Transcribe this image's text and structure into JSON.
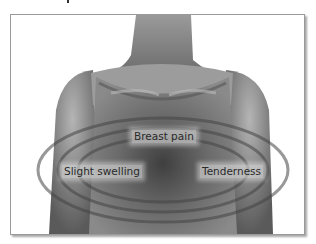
{
  "illustration": {
    "subject": "female torso in tank top with concentric rings around chest",
    "labels": {
      "center": "Breast pain",
      "left": "Slight swelling",
      "right": "Tenderness"
    },
    "colors": {
      "skin": "#8a8a8a",
      "shirt": "#6e6e6e",
      "rings": "#4a4a4a",
      "frame_border": "#9a9a9a"
    }
  }
}
